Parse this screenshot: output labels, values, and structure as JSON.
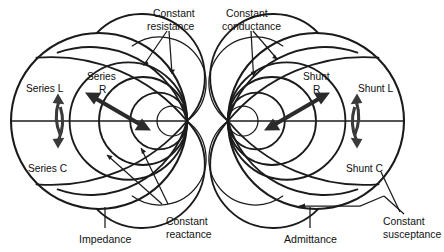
{
  "figure": {
    "background_color": "#ffffff",
    "line_color": "#1b1b1b",
    "arrow_color": "#2b2b2b"
  },
  "charts": [
    {
      "id": "impedance",
      "caption": "Impedance",
      "convergence_side": "right",
      "center": {
        "x": 99,
        "y": 121
      },
      "radius": 88,
      "grid_label_top": "Constant resistance",
      "grid_label_bottom": "Constant reactance",
      "component_labels": {
        "inductor": "Series L",
        "resistor_line1": "Series",
        "resistor_line2": "R",
        "capacitor": "Series C"
      }
    },
    {
      "id": "admittance",
      "caption": "Admittance",
      "convergence_side": "left",
      "center": {
        "x": 316,
        "y": 121
      },
      "radius": 88,
      "grid_label_top": "Constant conductance",
      "grid_label_bottom": "Constant susceptance",
      "component_labels": {
        "inductor": "Shunt L",
        "resistor_line1": "Shunt",
        "resistor_line2": "R",
        "capacitor": "Shunt C"
      }
    }
  ],
  "annotations": {
    "constant_resistance_l1": "Constant",
    "constant_resistance_l2": "resistance",
    "constant_conductance_l1": "Constant",
    "constant_conductance_l2": "conductance",
    "constant_reactance_l1": "Constant",
    "constant_reactance_l2": "reactance",
    "constant_susceptance_l1": "Constant",
    "constant_susceptance_l2": "susceptance",
    "impedance_caption": "Impedance",
    "admittance_caption": "Admittance",
    "series_l": "Series L",
    "series_r_l1": "Series",
    "series_r_l2": "R",
    "series_c": "Series C",
    "shunt_l": "Shunt L",
    "shunt_r_l1": "Shunt",
    "shunt_r_l2": "R",
    "shunt_c": "Shunt C"
  }
}
